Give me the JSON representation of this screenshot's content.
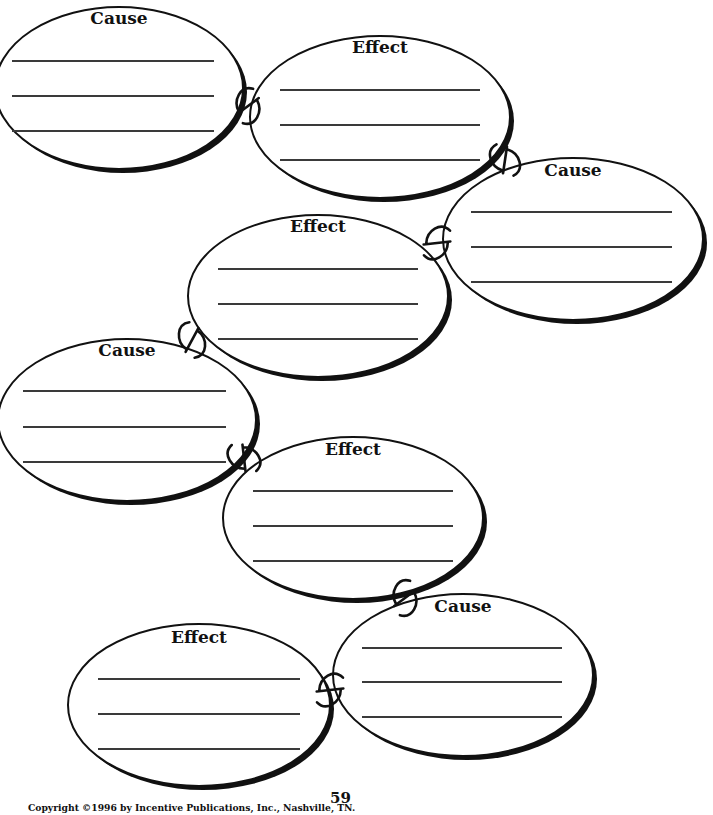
{
  "worksheet": {
    "type": "cause-and-effect chain graphic organizer",
    "ovals": [
      {
        "label": "Cause",
        "cx": 119,
        "cy": 88,
        "rx": 124,
        "ry": 81,
        "label_y": 10,
        "lines_y": [
          60,
          95,
          130
        ],
        "line_x": [
          12,
          214
        ]
      },
      {
        "label": "Effect",
        "cx": 380,
        "cy": 117,
        "rx": 130,
        "ry": 81,
        "label_y": 39,
        "lines_y": [
          89,
          124,
          159
        ],
        "line_x": [
          280,
          480
        ]
      },
      {
        "label": "Cause",
        "cx": 573,
        "cy": 239,
        "rx": 130,
        "ry": 81,
        "label_y": 162,
        "lines_y": [
          211,
          246,
          281
        ],
        "line_x": [
          471,
          672
        ]
      },
      {
        "label": "Effect",
        "cx": 318,
        "cy": 296,
        "rx": 130,
        "ry": 81,
        "label_y": 218,
        "lines_y": [
          268,
          303,
          338
        ],
        "line_x": [
          218,
          418
        ]
      },
      {
        "label": "Cause",
        "cx": 127,
        "cy": 420,
        "rx": 129,
        "ry": 81,
        "label_y": 342,
        "lines_y": [
          390,
          426,
          461
        ],
        "line_x": [
          23,
          226
        ]
      },
      {
        "label": "Effect",
        "cx": 353,
        "cy": 518,
        "rx": 130,
        "ry": 81,
        "label_y": 441,
        "lines_y": [
          490,
          525,
          560
        ],
        "line_x": [
          253,
          453
        ]
      },
      {
        "label": "Cause",
        "cx": 463,
        "cy": 675,
        "rx": 130,
        "ry": 81,
        "label_y": 598,
        "lines_y": [
          647,
          681,
          716
        ],
        "line_x": [
          362,
          562
        ]
      },
      {
        "label": "Effect",
        "cx": 199,
        "cy": 705,
        "rx": 131,
        "ry": 81,
        "label_y": 629,
        "lines_y": [
          678,
          713,
          748
        ],
        "line_x": [
          98,
          300
        ]
      }
    ],
    "connectors": [
      {
        "x": 248,
        "y": 106,
        "angle": 80
      },
      {
        "x": 505,
        "y": 160,
        "angle": 35
      },
      {
        "x": 437,
        "y": 243,
        "angle": 110
      },
      {
        "x": 192,
        "y": 340,
        "angle": 55
      },
      {
        "x": 244,
        "y": 458,
        "angle": 20
      },
      {
        "x": 405,
        "y": 598,
        "angle": 80
      },
      {
        "x": 330,
        "y": 690,
        "angle": 110
      }
    ],
    "colors": {
      "ink": "#111111",
      "line": "#3a3a3a",
      "paper": "#ffffff"
    }
  },
  "footer": {
    "page_number": "59",
    "copyright": "Copyright ©1996 by Incentive Publications, Inc., Nashville, TN."
  }
}
